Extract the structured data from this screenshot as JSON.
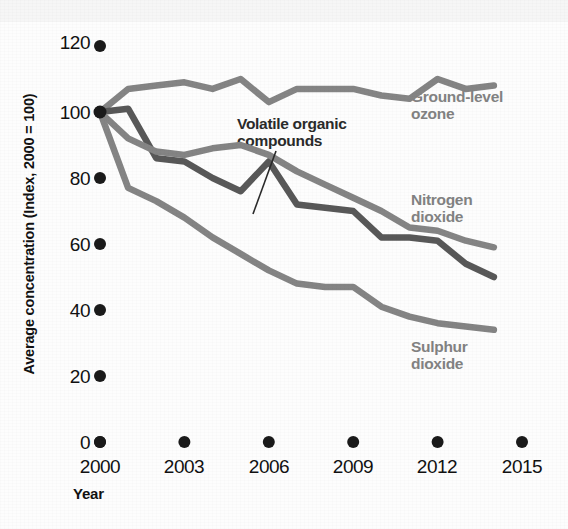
{
  "chart_data": {
    "type": "line",
    "title": "",
    "xlabel": "Year",
    "ylabel": "Average concentration (Index, 2000 = 100)",
    "x": [
      2000,
      2001,
      2002,
      2003,
      2004,
      2005,
      2006,
      2007,
      2008,
      2009,
      2010,
      2011,
      2012,
      2013,
      2014
    ],
    "xticks": [
      2000,
      2003,
      2006,
      2009,
      2012,
      2015
    ],
    "yticks": [
      0,
      20,
      40,
      60,
      80,
      100,
      120
    ],
    "xlim": [
      2000,
      2015
    ],
    "ylim": [
      0,
      120
    ],
    "grid": false,
    "legend": "inline-annotations",
    "series": [
      {
        "name": "Ground-level ozone",
        "color": "#848484",
        "values": [
          100,
          107,
          108,
          109,
          107,
          110,
          103,
          107,
          107,
          107,
          105,
          104,
          110,
          107,
          108
        ]
      },
      {
        "name": "Volatile organic compounds",
        "color": "#585858",
        "values": [
          100,
          101,
          86,
          85,
          80,
          76,
          85,
          72,
          71,
          70,
          62,
          62,
          61,
          54,
          50
        ]
      },
      {
        "name": "Nitrogen dioxide",
        "color": "#848484",
        "values": [
          100,
          92,
          88,
          87,
          89,
          90,
          87,
          82,
          78,
          74,
          70,
          65,
          64,
          61,
          59
        ]
      },
      {
        "name": "Sulphur dioxide",
        "color": "#848484",
        "values": [
          100,
          77,
          73,
          68,
          62,
          57,
          52,
          48,
          47,
          47,
          41,
          38,
          36,
          35,
          34
        ]
      }
    ]
  },
  "axis": {
    "y_label": "Average concentration (Index, 2000 = 100)",
    "x_label": "Year",
    "y_tick_labels": [
      "120",
      "100",
      "80",
      "60",
      "40",
      "20",
      "0"
    ],
    "x_tick_labels": [
      "2000",
      "2003",
      "2006",
      "2009",
      "2012",
      "2015"
    ]
  },
  "annotations": {
    "ozone": "Ground-level\nozone",
    "nitrogen_dioxide": "Nitrogen\ndioxide",
    "sulphur_dioxide": "Sulphur\ndioxide",
    "voc": "Volatile organic\ncompounds"
  },
  "colors": {
    "line_light": "#848484",
    "line_dark": "#585858",
    "text": "#111111",
    "label_gray": "#828282",
    "background": "#fdfdfd"
  }
}
